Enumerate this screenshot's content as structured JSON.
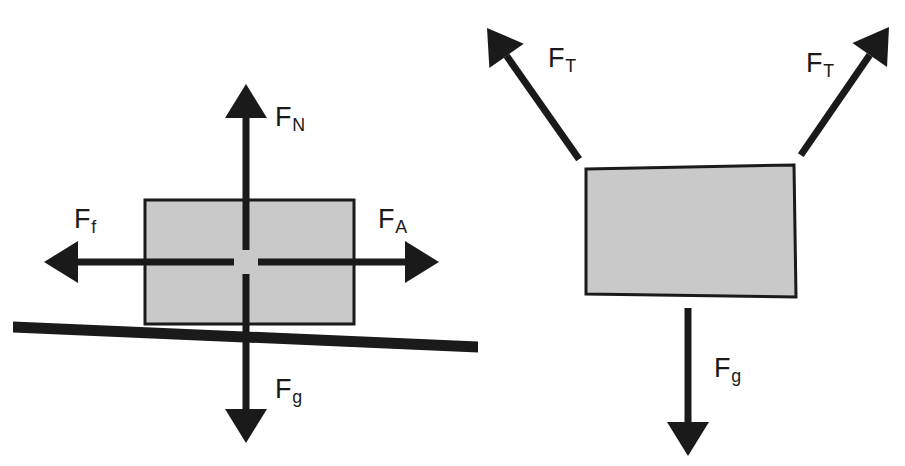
{
  "figure": {
    "background_color": "#ffffff",
    "stroke_color": "#1a1a1a",
    "box_fill_color": "#c9c9c9",
    "box_stroke_color": "#1a1a1a",
    "ground_color": "#1a1a1a"
  },
  "diagrams": [
    {
      "id": "block-on-surface",
      "name": "Block on horizontal surface with applied force and friction",
      "box": {
        "name": "block",
        "x": 145,
        "y": 200,
        "width": 209,
        "height": 124,
        "fill": "#c9c9c9",
        "stroke": "#1a1a1a"
      },
      "ground": {
        "name": "ground-surface",
        "x1": 13,
        "y1": 327,
        "x2": 478,
        "y2": 347,
        "thickness": 11
      },
      "forces": [
        {
          "id": "normal-force",
          "label": "F",
          "subscript": "N",
          "direction": "up",
          "tail_x": 246,
          "tail_y": 262,
          "tip_x": 246,
          "tip_y": 84,
          "label_x": 275,
          "label_y": 104
        },
        {
          "id": "friction-force",
          "label": "F",
          "subscript": "f",
          "direction": "left",
          "tail_x": 246,
          "tail_y": 262,
          "tip_x": 44,
          "tip_y": 262,
          "label_x": 74,
          "label_y": 206
        },
        {
          "id": "applied-force",
          "label": "F",
          "subscript": "A",
          "direction": "right",
          "tail_x": 246,
          "tail_y": 262,
          "tip_x": 439,
          "tip_y": 262,
          "label_x": 378,
          "label_y": 206
        },
        {
          "id": "gravity-force",
          "label": "F",
          "subscript": "g",
          "direction": "down",
          "tail_x": 246,
          "tail_y": 262,
          "tip_x": 246,
          "tip_y": 443,
          "label_x": 275,
          "label_y": 376
        }
      ]
    },
    {
      "id": "hanging-block",
      "name": "Block suspended by two tension ropes",
      "box": {
        "name": "block",
        "corners": "586,169 794,165 796,297 586,294",
        "fill": "#c9c9c9",
        "stroke": "#1a1a1a"
      },
      "forces": [
        {
          "id": "tension-force-left",
          "label": "F",
          "subscript": "T",
          "direction": "up-left",
          "tail_x": 586,
          "tail_y": 169,
          "tip_x": 487,
          "tip_y": 28,
          "label_x": 548,
          "label_y": 45
        },
        {
          "id": "tension-force-right",
          "label": "F",
          "subscript": "T",
          "direction": "up-right",
          "tail_x": 794,
          "tail_y": 165,
          "tip_x": 889,
          "tip_y": 27,
          "label_x": 806,
          "label_y": 50
        },
        {
          "id": "gravity-force",
          "label": "F",
          "subscript": "g",
          "direction": "down",
          "tail_x": 688,
          "tail_y": 296,
          "tip_x": 688,
          "tip_y": 456,
          "label_x": 714,
          "label_y": 355
        }
      ]
    }
  ]
}
